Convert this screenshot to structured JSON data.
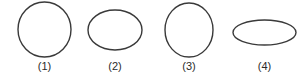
{
  "figure": {
    "name": "multiple-choice-shape-options",
    "background_color": "#ffffff",
    "stroke_color": "#3a3a3a",
    "label_color": "#2b2b2b",
    "stroke_width": 1.4,
    "width": 307,
    "height": 77
  },
  "options": [
    {
      "label": "(1)",
      "shape": "circle",
      "cx": 44.5,
      "cy": 29.5,
      "rx": 26.5,
      "ry": 27.5,
      "label_x": 44.5,
      "label_y": 70
    },
    {
      "label": "(2)",
      "shape": "ellipse-wide",
      "cx": 115,
      "cy": 30,
      "rx": 27,
      "ry": 20,
      "label_x": 115,
      "label_y": 70
    },
    {
      "label": "(3)",
      "shape": "ellipse-tall",
      "cx": 189,
      "cy": 30,
      "rx": 24,
      "ry": 27,
      "label_x": 189,
      "label_y": 70
    },
    {
      "label": "(4)",
      "shape": "ellipse-flat",
      "cx": 264.5,
      "cy": 32.5,
      "rx": 31.5,
      "ry": 12.5,
      "label_x": 264.5,
      "label_y": 70
    }
  ]
}
